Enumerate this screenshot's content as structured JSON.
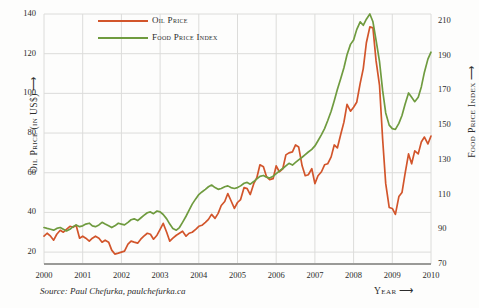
{
  "chart_data": {
    "type": "line",
    "title": "",
    "subtitle": "",
    "xlabel": "Year",
    "ylabel": "Oil Price (in US$)",
    "y2label": "Food Price Index",
    "grid": true,
    "legend_position": "top-left",
    "xlim": [
      2000,
      2010
    ],
    "ylim": [
      14,
      140
    ],
    "y2lim": [
      70,
      214
    ],
    "xticks": [
      "2000",
      "2001",
      "2002",
      "2003",
      "2004",
      "2005",
      "2006",
      "2007",
      "2008",
      "2009",
      "2010"
    ],
    "yticks": [
      "20",
      "40",
      "60",
      "80",
      "100",
      "120",
      "140"
    ],
    "y2ticks": [
      "70",
      "90",
      "110",
      "130",
      "150",
      "170",
      "190",
      "210"
    ],
    "ytick_values": [
      20,
      40,
      60,
      80,
      100,
      120,
      140
    ],
    "y2tick_values": [
      70,
      90,
      110,
      130,
      150,
      170,
      190,
      210
    ],
    "xtick_values": [
      2000,
      2001,
      2002,
      2003,
      2004,
      2005,
      2006,
      2007,
      2008,
      2009,
      2010
    ],
    "source": "Source: Paul Chefurka, paulchefurka.ca",
    "series": [
      {
        "name": "Oil Price",
        "color": "#d2552b",
        "axis": "left",
        "x": [
          2000.0,
          2000.08,
          2000.17,
          2000.25,
          2000.33,
          2000.42,
          2000.5,
          2000.58,
          2000.67,
          2000.75,
          2000.83,
          2000.92,
          2001.0,
          2001.08,
          2001.17,
          2001.25,
          2001.33,
          2001.42,
          2001.5,
          2001.58,
          2001.67,
          2001.75,
          2001.83,
          2001.92,
          2002.0,
          2002.08,
          2002.17,
          2002.25,
          2002.33,
          2002.42,
          2002.5,
          2002.58,
          2002.67,
          2002.75,
          2002.83,
          2002.92,
          2003.0,
          2003.08,
          2003.17,
          2003.25,
          2003.33,
          2003.42,
          2003.5,
          2003.58,
          2003.67,
          2003.75,
          2003.83,
          2003.92,
          2004.0,
          2004.08,
          2004.17,
          2004.25,
          2004.33,
          2004.42,
          2004.5,
          2004.58,
          2004.67,
          2004.75,
          2004.83,
          2004.92,
          2005.0,
          2005.08,
          2005.17,
          2005.25,
          2005.33,
          2005.42,
          2005.5,
          2005.58,
          2005.67,
          2005.75,
          2005.83,
          2005.92,
          2006.0,
          2006.08,
          2006.17,
          2006.25,
          2006.33,
          2006.42,
          2006.5,
          2006.58,
          2006.67,
          2006.75,
          2006.83,
          2006.92,
          2007.0,
          2007.08,
          2007.17,
          2007.25,
          2007.33,
          2007.42,
          2007.5,
          2007.58,
          2007.67,
          2007.75,
          2007.83,
          2007.92,
          2008.0,
          2008.08,
          2008.17,
          2008.25,
          2008.33,
          2008.42,
          2008.5,
          2008.58,
          2008.67,
          2008.75,
          2008.83,
          2008.92,
          2009.0,
          2009.08,
          2009.17,
          2009.25,
          2009.33,
          2009.42,
          2009.5,
          2009.58,
          2009.67,
          2009.75,
          2009.83,
          2009.92,
          2010.0
        ],
        "values": [
          28.0,
          29.5,
          28.0,
          26.0,
          29.0,
          31.0,
          30.0,
          31.5,
          33.0,
          32.5,
          33.5,
          27.0,
          28.0,
          27.0,
          25.5,
          27.0,
          28.0,
          27.0,
          25.0,
          26.0,
          25.0,
          21.0,
          19.0,
          19.5,
          20.0,
          20.5,
          24.0,
          25.5,
          25.0,
          24.5,
          26.5,
          28.0,
          29.5,
          29.0,
          26.5,
          28.5,
          31.5,
          34.5,
          30.0,
          25.5,
          27.0,
          28.5,
          29.5,
          30.5,
          28.0,
          29.5,
          30.0,
          31.5,
          33.0,
          33.5,
          35.0,
          36.5,
          39.0,
          37.0,
          39.5,
          43.5,
          45.5,
          49.5,
          46.0,
          42.0,
          45.0,
          46.5,
          52.5,
          52.0,
          49.0,
          54.5,
          57.5,
          64.0,
          63.0,
          58.0,
          56.5,
          57.0,
          63.5,
          60.5,
          62.0,
          69.0,
          70.0,
          70.5,
          74.0,
          73.0,
          63.5,
          58.5,
          59.0,
          62.0,
          54.5,
          58.5,
          60.5,
          64.0,
          64.5,
          68.0,
          74.0,
          72.5,
          79.5,
          85.5,
          94.5,
          91.0,
          93.0,
          95.5,
          105.0,
          112.5,
          125.5,
          133.5,
          133.0,
          116.5,
          104.0,
          77.0,
          54.5,
          42.5,
          42.0,
          39.0,
          48.0,
          50.0,
          59.5,
          69.5,
          64.5,
          71.0,
          69.5,
          75.5,
          78.0,
          74.5,
          78.5
        ]
      },
      {
        "name": "Food Price Index",
        "color": "#6f9b3f",
        "axis": "right",
        "x": [
          2000.0,
          2000.08,
          2000.17,
          2000.25,
          2000.33,
          2000.42,
          2000.5,
          2000.58,
          2000.67,
          2000.75,
          2000.83,
          2000.92,
          2001.0,
          2001.08,
          2001.17,
          2001.25,
          2001.33,
          2001.42,
          2001.5,
          2001.58,
          2001.67,
          2001.75,
          2001.83,
          2001.92,
          2002.0,
          2002.08,
          2002.17,
          2002.25,
          2002.33,
          2002.42,
          2002.5,
          2002.58,
          2002.67,
          2002.75,
          2002.83,
          2002.92,
          2003.0,
          2003.08,
          2003.17,
          2003.25,
          2003.33,
          2003.42,
          2003.5,
          2003.58,
          2003.67,
          2003.75,
          2003.83,
          2003.92,
          2004.0,
          2004.08,
          2004.17,
          2004.25,
          2004.33,
          2004.42,
          2004.5,
          2004.58,
          2004.67,
          2004.75,
          2004.83,
          2004.92,
          2005.0,
          2005.08,
          2005.17,
          2005.25,
          2005.33,
          2005.42,
          2005.5,
          2005.58,
          2005.67,
          2005.75,
          2005.83,
          2005.92,
          2006.0,
          2006.08,
          2006.17,
          2006.25,
          2006.33,
          2006.42,
          2006.5,
          2006.58,
          2006.67,
          2006.75,
          2006.83,
          2006.92,
          2007.0,
          2007.08,
          2007.17,
          2007.25,
          2007.33,
          2007.42,
          2007.5,
          2007.58,
          2007.67,
          2007.75,
          2007.83,
          2007.92,
          2008.0,
          2008.08,
          2008.17,
          2008.25,
          2008.33,
          2008.42,
          2008.5,
          2008.58,
          2008.67,
          2008.75,
          2008.83,
          2008.92,
          2009.0,
          2009.08,
          2009.17,
          2009.25,
          2009.33,
          2009.42,
          2009.5,
          2009.58,
          2009.67,
          2009.75,
          2009.83,
          2009.92,
          2010.0
        ],
        "values": [
          91.0,
          90.5,
          90.0,
          89.5,
          90.5,
          91.0,
          90.0,
          89.0,
          90.0,
          91.5,
          92.5,
          91.5,
          92.0,
          93.0,
          93.5,
          92.0,
          91.5,
          92.5,
          94.0,
          93.0,
          92.0,
          91.0,
          92.0,
          93.5,
          93.0,
          92.5,
          94.0,
          95.5,
          96.0,
          95.0,
          96.5,
          98.0,
          99.5,
          100.0,
          99.0,
          100.5,
          100.0,
          98.5,
          96.0,
          93.0,
          90.5,
          89.5,
          91.0,
          94.0,
          97.5,
          101.0,
          104.5,
          107.5,
          110.0,
          111.5,
          113.0,
          114.5,
          115.5,
          114.0,
          113.0,
          113.5,
          114.5,
          115.0,
          114.0,
          113.5,
          114.0,
          115.0,
          116.5,
          117.0,
          116.0,
          117.5,
          119.0,
          120.5,
          121.0,
          120.0,
          119.5,
          120.5,
          122.0,
          123.5,
          125.0,
          126.5,
          128.0,
          127.0,
          128.5,
          130.0,
          131.5,
          133.0,
          134.5,
          136.0,
          138.0,
          141.0,
          144.5,
          148.0,
          152.5,
          158.0,
          164.0,
          170.5,
          177.0,
          183.0,
          190.5,
          196.5,
          199.0,
          205.0,
          209.5,
          207.5,
          211.0,
          214.0,
          209.5,
          199.0,
          186.5,
          170.0,
          157.0,
          150.0,
          148.0,
          147.5,
          151.0,
          155.5,
          162.0,
          168.5,
          166.0,
          163.5,
          166.0,
          172.0,
          180.5,
          188.0,
          192.0
        ]
      }
    ],
    "annotations": []
  },
  "legend": {
    "items": [
      {
        "label": "Oil Price",
        "color": "#d2552b"
      },
      {
        "label": "Food Price Index",
        "color": "#6f9b3f"
      }
    ]
  },
  "axes": {
    "left_title": "Oil Price (in US$) ⟶",
    "right_title": "Food Price Index ⟶",
    "x_title": "Year ⟶"
  },
  "footer": {
    "source": "Source: Paul Chefurka, paulchefurka.ca"
  },
  "colors": {
    "oil": "#d2552b",
    "food": "#6f9b3f",
    "grid": "#dcdcda",
    "axis": "#9a9a97",
    "background": "#fdfdfc",
    "text": "#2b2b2b"
  }
}
